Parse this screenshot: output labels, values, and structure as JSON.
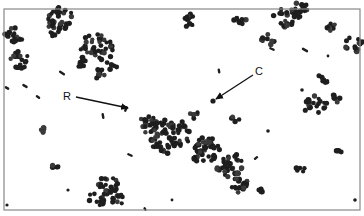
{
  "figure": {
    "frame": {
      "x": 4,
      "y": 9,
      "width": 356,
      "height": 201,
      "stroke": "#888888"
    },
    "colors": {
      "cell": "#1e1e1e",
      "cell_light": "#3a3a3a",
      "background": "#ffffff",
      "text": "#111111"
    },
    "labels": [
      {
        "id": "R",
        "text": "R",
        "x": 63,
        "y": 91,
        "arrow": {
          "x1": 76,
          "y1": 97,
          "x2": 128,
          "y2": 108
        }
      },
      {
        "id": "C",
        "text": "C",
        "x": 255,
        "y": 66,
        "arrow": {
          "x1": 253,
          "y1": 75,
          "x2": 216,
          "y2": 99
        }
      }
    ],
    "clusters": [
      {
        "cx": 62,
        "cy": 18,
        "r": 14,
        "n": 26
      },
      {
        "cx": 55,
        "cy": 30,
        "r": 8,
        "n": 10
      },
      {
        "cx": 14,
        "cy": 35,
        "r": 10,
        "n": 16
      },
      {
        "cx": 20,
        "cy": 60,
        "r": 10,
        "n": 16
      },
      {
        "cx": 97,
        "cy": 48,
        "r": 17,
        "n": 38
      },
      {
        "cx": 80,
        "cy": 62,
        "r": 8,
        "n": 10
      },
      {
        "cx": 100,
        "cy": 75,
        "r": 7,
        "n": 8
      },
      {
        "cx": 112,
        "cy": 65,
        "r": 6,
        "n": 6
      },
      {
        "cx": 188,
        "cy": 20,
        "r": 8,
        "n": 12
      },
      {
        "cx": 240,
        "cy": 20,
        "r": 6,
        "n": 8
      },
      {
        "cx": 285,
        "cy": 18,
        "r": 12,
        "n": 20
      },
      {
        "cx": 300,
        "cy": 10,
        "r": 10,
        "n": 14
      },
      {
        "cx": 268,
        "cy": 40,
        "r": 7,
        "n": 10
      },
      {
        "cx": 332,
        "cy": 26,
        "r": 6,
        "n": 8
      },
      {
        "cx": 354,
        "cy": 45,
        "r": 10,
        "n": 14
      },
      {
        "cx": 322,
        "cy": 80,
        "r": 6,
        "n": 8
      },
      {
        "cx": 315,
        "cy": 105,
        "r": 12,
        "n": 20
      },
      {
        "cx": 336,
        "cy": 98,
        "r": 5,
        "n": 6
      },
      {
        "cx": 168,
        "cy": 135,
        "r": 22,
        "n": 70
      },
      {
        "cx": 148,
        "cy": 125,
        "r": 10,
        "n": 18
      },
      {
        "cx": 205,
        "cy": 150,
        "r": 16,
        "n": 44
      },
      {
        "cx": 230,
        "cy": 165,
        "r": 14,
        "n": 34
      },
      {
        "cx": 240,
        "cy": 185,
        "r": 9,
        "n": 16
      },
      {
        "cx": 194,
        "cy": 115,
        "r": 5,
        "n": 6
      },
      {
        "cx": 236,
        "cy": 118,
        "r": 5,
        "n": 6
      },
      {
        "cx": 300,
        "cy": 170,
        "r": 5,
        "n": 6
      },
      {
        "cx": 340,
        "cy": 152,
        "r": 4,
        "n": 4
      },
      {
        "cx": 108,
        "cy": 185,
        "r": 11,
        "n": 22
      },
      {
        "cx": 98,
        "cy": 198,
        "r": 9,
        "n": 14
      },
      {
        "cx": 118,
        "cy": 200,
        "r": 7,
        "n": 10
      },
      {
        "cx": 43,
        "cy": 130,
        "r": 4,
        "n": 6
      },
      {
        "cx": 55,
        "cy": 165,
        "r": 4,
        "n": 5
      },
      {
        "cx": 261,
        "cy": 192,
        "r": 4,
        "n": 5
      }
    ],
    "single_cells": [
      {
        "x": 213,
        "y": 101,
        "r": 2.6
      },
      {
        "x": 68,
        "y": 190,
        "r": 1.6
      },
      {
        "x": 172,
        "y": 200,
        "r": 1.4
      },
      {
        "x": 355,
        "y": 200,
        "r": 1.8
      },
      {
        "x": 268,
        "y": 131,
        "r": 1.8
      },
      {
        "x": 302,
        "y": 90,
        "r": 1.8
      },
      {
        "x": 7,
        "y": 205,
        "r": 1.6
      },
      {
        "x": 328,
        "y": 56,
        "r": 1.4
      }
    ],
    "rods": [
      {
        "x": 62,
        "y": 73,
        "len": 7,
        "angle": 35
      },
      {
        "x": 25,
        "y": 86,
        "len": 6,
        "angle": 30
      },
      {
        "x": 7,
        "y": 88,
        "len": 5,
        "angle": 30
      },
      {
        "x": 38,
        "y": 97,
        "len": 5,
        "angle": 35
      },
      {
        "x": 126,
        "y": 109,
        "len": 6,
        "angle": -65
      },
      {
        "x": 103,
        "y": 116,
        "len": 6,
        "angle": 80
      },
      {
        "x": 272,
        "y": 49,
        "len": 6,
        "angle": 25
      },
      {
        "x": 305,
        "y": 50,
        "len": 7,
        "angle": 30
      },
      {
        "x": 219,
        "y": 71,
        "len": 5,
        "angle": 80
      },
      {
        "x": 130,
        "y": 155,
        "len": 6,
        "angle": 25
      },
      {
        "x": 256,
        "y": 158,
        "len": 5,
        "angle": -40
      },
      {
        "x": 145,
        "y": 209,
        "len": 4,
        "angle": 60
      }
    ]
  }
}
